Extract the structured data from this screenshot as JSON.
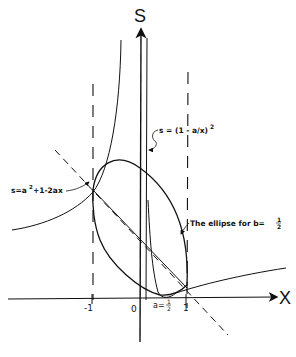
{
  "diagram": {
    "axes": {
      "x_label": "X",
      "y_label": "S"
    },
    "ticks": {
      "neg_one": "-1",
      "zero": "0",
      "one": "1",
      "a_label": "a=",
      "a_num": "1",
      "a_den": "2"
    },
    "annotations": {
      "hyperbola": {
        "prefix": "s = (1 - a/x)",
        "exponent": "2"
      },
      "line": {
        "text_s": "s=a",
        "exponent": "2",
        "text_rest": "+1-2ax"
      },
      "ellipse": {
        "text": "The ellipse for  b=",
        "num": "1",
        "den": "2"
      }
    },
    "colors": {
      "ink": "#111111",
      "background": "#ffffff"
    }
  }
}
